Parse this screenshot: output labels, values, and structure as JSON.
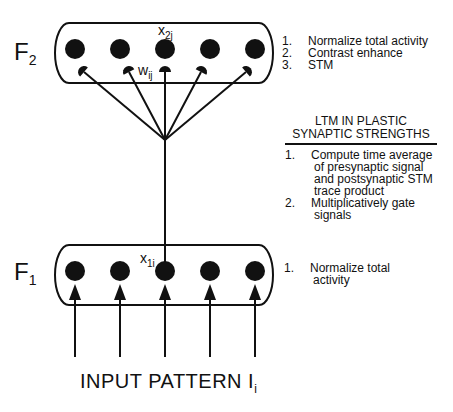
{
  "f2": {
    "label": "F",
    "label_sub": "2",
    "node_count": 5,
    "node_var": "x",
    "node_var_sub": "2j",
    "weight_var": "w",
    "weight_var_sub": "ij",
    "notes": [
      {
        "num": "1.",
        "text": "Normalize total activity"
      },
      {
        "num": "2.",
        "text": "Contrast enhance"
      },
      {
        "num": "3.",
        "text": "STM"
      }
    ]
  },
  "ltm": {
    "title_line1": "LTM IN PLASTIC",
    "title_line2": "SYNAPTIC STRENGTHS",
    "items": [
      {
        "num": "1.",
        "lines": [
          "Compute time average",
          "of presynaptic signal",
          "and postsynaptic STM",
          "trace product"
        ]
      },
      {
        "num": "2.",
        "lines": [
          "Multiplicatively gate",
          "signals"
        ]
      }
    ]
  },
  "f1": {
    "label": "F",
    "label_sub": "1",
    "node_count": 5,
    "node_var": "x",
    "node_var_sub": "1i",
    "notes": [
      {
        "num": "1.",
        "lines": [
          "Normalize total",
          "activity"
        ]
      }
    ]
  },
  "input": {
    "label": "INPUT  PATTERN  I",
    "label_sub": "i"
  }
}
